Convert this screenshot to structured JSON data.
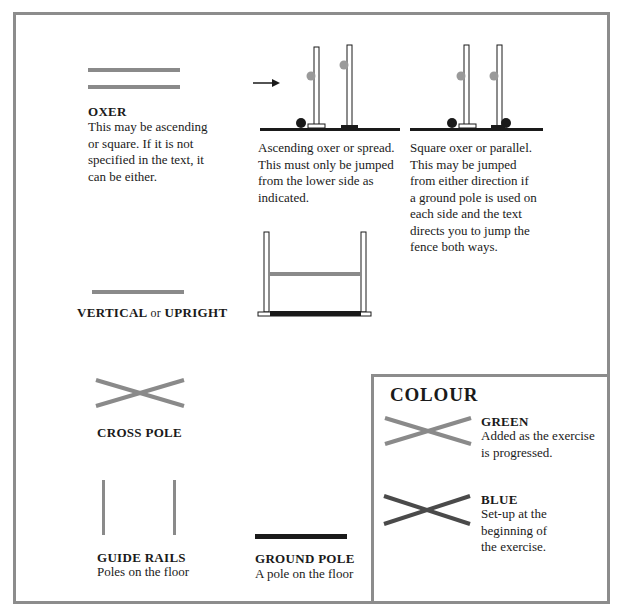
{
  "legend": {
    "oxer": {
      "title": "OXER",
      "description": "This may be ascending or square. If it is not specified in the text, it can be either.",
      "lines": [
        "This may be ascending",
        "or square. If it is not",
        "specified in the text, it",
        "can be either."
      ]
    },
    "ascending_oxer": {
      "lines": [
        "Ascending oxer or spread.",
        "This must only be jumped",
        "from the lower side as",
        "indicated."
      ]
    },
    "square_oxer": {
      "lines": [
        "Square oxer or parallel.",
        "This may be jumped",
        "from either direction if",
        "a ground pole is used on",
        "each side and the text",
        "directs you to jump the",
        "fence both ways."
      ]
    },
    "vertical": {
      "title_part1": "VERTICAL",
      "title_joiner": "or",
      "title_part2": "UPRIGHT"
    },
    "cross_pole": {
      "title": "CROSS POLE"
    },
    "guide_rails": {
      "title": "GUIDE RAILS",
      "description": "Poles on the floor"
    },
    "ground_pole": {
      "title": "GROUND POLE",
      "description": "A pole on the floor"
    }
  },
  "colour": {
    "title": "COLOUR",
    "items": [
      {
        "name": "GREEN",
        "lines": [
          "Added as the exercise",
          "is progressed."
        ],
        "color": "#8a8a8a"
      },
      {
        "name": "BLUE",
        "lines": [
          "Set-up at the",
          "beginning of",
          "the exercise."
        ],
        "color": "#4a4a4a"
      }
    ]
  },
  "colors": {
    "border": "#8c8c8c",
    "pole_green": "#8a8a8a",
    "pole_blue": "#4a4a4a",
    "ground": "#1a1a1a",
    "cup": "#9a9a9a"
  }
}
